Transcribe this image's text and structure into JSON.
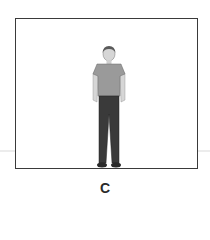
{
  "panel": {
    "label": "C",
    "figure": {
      "description": "standing man, front view",
      "colors": {
        "hair": "#5a5a5a",
        "skin": "#d6d6d6",
        "shirt": "#9a9a9a",
        "pants": "#3a3a3a",
        "shoes": "#2a2a2a"
      }
    },
    "frame_color": "#3a3a3a"
  }
}
